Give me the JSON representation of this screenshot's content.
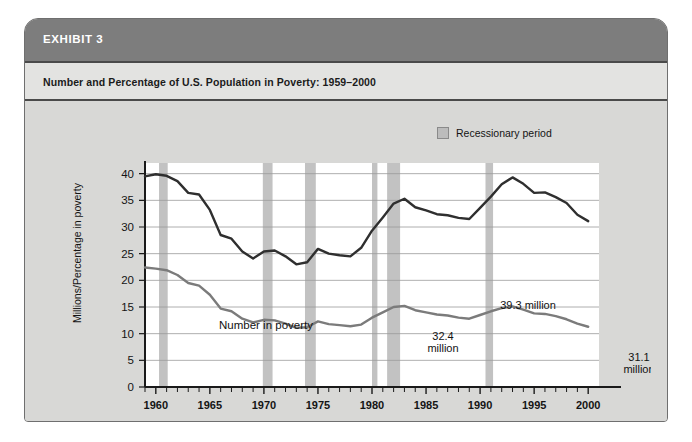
{
  "exhibit": {
    "header_label": "EXHIBIT 3",
    "subtitle": "Number and Percentage of U.S. Population in Poverty: 1959–2000"
  },
  "legend": {
    "swatch_name": "recession-swatch",
    "label": "Recessionary period"
  },
  "colors": {
    "card_background": "#d8d8d6",
    "header_band": "#7d7d7d",
    "subtitle_band": "#e3e3e1",
    "plot_background": "#ffffff",
    "recession_band": "#c2c2c2",
    "gridline": "#9a9a9a",
    "axis": "#1a1a1a",
    "number_line": "#2f2f2f",
    "rate_line": "#7b7b7b"
  },
  "chart_data": {
    "type": "line",
    "title": "Number and Percentage of U.S. Population in Poverty: 1959–2000",
    "xlabel": "",
    "ylabel": "Millions/Percentage in poverty",
    "xlim": [
      1959,
      2001
    ],
    "ylim": [
      0,
      42
    ],
    "yticks": [
      0,
      5,
      10,
      15,
      20,
      25,
      30,
      35,
      40
    ],
    "ytick_labels": [
      "0",
      "5",
      "10",
      "15",
      "20",
      "25",
      "30",
      "35",
      "40"
    ],
    "xticks": [
      1960,
      1965,
      1970,
      1975,
      1980,
      1985,
      1990,
      1995,
      2000
    ],
    "xtick_labels": [
      "1960",
      "1965",
      "1970",
      "1975",
      "1980",
      "1985",
      "1990",
      "1995",
      "2000"
    ],
    "xtick_minor_step": 1,
    "grid": "horizontal",
    "legend_position": "above-right",
    "x": [
      1959,
      1960,
      1961,
      1962,
      1963,
      1964,
      1965,
      1966,
      1967,
      1968,
      1969,
      1970,
      1971,
      1972,
      1973,
      1974,
      1975,
      1976,
      1977,
      1978,
      1979,
      1980,
      1981,
      1982,
      1983,
      1984,
      1985,
      1986,
      1987,
      1988,
      1989,
      1990,
      1991,
      1992,
      1993,
      1994,
      1995,
      1996,
      1997,
      1998,
      1999,
      2000
    ],
    "series": [
      {
        "name": "Number in poverty",
        "units": "millions",
        "color": "#2f2f2f",
        "values": [
          39.5,
          39.9,
          39.6,
          38.6,
          36.4,
          36.1,
          33.2,
          28.5,
          27.8,
          25.4,
          24.1,
          25.4,
          25.6,
          24.5,
          23.0,
          23.4,
          25.9,
          25.0,
          24.7,
          24.5,
          26.1,
          29.3,
          31.8,
          34.4,
          35.3,
          33.7,
          33.1,
          32.4,
          32.2,
          31.7,
          31.5,
          33.6,
          35.7,
          38.0,
          39.3,
          38.1,
          36.4,
          36.5,
          35.6,
          34.5,
          32.3,
          31.1
        ],
        "annotations": [
          {
            "label": "32.4 million",
            "x": 1986,
            "value": 32.4
          },
          {
            "label": "39.3 million",
            "x": 1993,
            "value": 39.3
          },
          {
            "label": "31.1 million",
            "x": 2000,
            "value": 31.1
          }
        ]
      },
      {
        "name": "Poverty rate",
        "units": "percent",
        "color": "#7b7b7b",
        "values": [
          22.4,
          22.2,
          21.9,
          21.0,
          19.5,
          19.0,
          17.3,
          14.7,
          14.2,
          12.8,
          12.1,
          12.6,
          12.5,
          11.9,
          11.1,
          11.2,
          12.3,
          11.8,
          11.6,
          11.4,
          11.7,
          13.0,
          14.0,
          15.0,
          15.2,
          14.4,
          14.0,
          13.6,
          13.4,
          13.0,
          12.8,
          13.5,
          14.2,
          14.8,
          15.1,
          14.5,
          13.8,
          13.7,
          13.3,
          12.7,
          11.9,
          11.3
        ],
        "annotations": [
          {
            "label": "13.1%",
            "x": 1986,
            "value": 13.6
          },
          {
            "label": "15.1%",
            "x": 1993,
            "value": 15.1
          },
          {
            "label": "11.3%",
            "x": 2000,
            "value": 11.3
          }
        ]
      }
    ],
    "recession_bands": [
      {
        "start": 1960.3,
        "end": 1961.1
      },
      {
        "start": 1969.9,
        "end": 1970.8
      },
      {
        "start": 1973.8,
        "end": 1974.8
      },
      {
        "start": 1980.0,
        "end": 1980.5
      },
      {
        "start": 1981.4,
        "end": 1982.6
      },
      {
        "start": 1990.5,
        "end": 1991.2
      }
    ],
    "series_tags": [
      {
        "text": "Number in poverty",
        "series": "Number in poverty"
      },
      {
        "text": "Poverty rate",
        "series": "Poverty rate"
      }
    ]
  }
}
